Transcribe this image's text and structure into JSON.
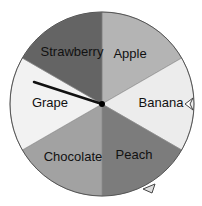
{
  "wheel": {
    "center": [
      102,
      104
    ],
    "radius": 92,
    "sectors": [
      {
        "label": "Apple",
        "color": "#b4b4b4",
        "label_pos": [
          130,
          58
        ]
      },
      {
        "label": "Banana",
        "color": "#ececec",
        "label_pos": [
          161,
          107
        ]
      },
      {
        "label": "Peach",
        "color": "#7c7c7c",
        "label_pos": [
          134,
          159
        ]
      },
      {
        "label": "Chocolate",
        "color": "#a2a2a2",
        "label_pos": [
          73,
          161
        ]
      },
      {
        "label": "Grape",
        "color": "#f2f2f2",
        "label_pos": [
          50,
          107
        ]
      },
      {
        "label": "Strawberry",
        "color": "#646464",
        "label_pos": [
          72,
          56
        ]
      }
    ],
    "needle": {
      "tip": [
        34,
        82
      ]
    },
    "markers": [
      "banana-marker",
      "peach-marker"
    ]
  }
}
